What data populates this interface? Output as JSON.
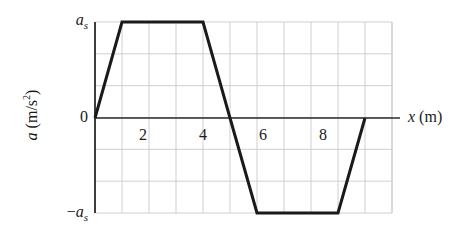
{
  "chart_data": {
    "type": "line",
    "title": "",
    "xlabel": "x (m)",
    "ylabel": "a (m/s2)",
    "ylabel_var": "a",
    "ylabel_unit_open": " (m/s",
    "ylabel_unit_exp": "2",
    "ylabel_unit_close": ")",
    "xlabel_var": "x",
    "xlabel_unit": " (m)",
    "x": [
      0,
      1,
      4,
      5,
      6,
      9,
      10
    ],
    "values": [
      0,
      1,
      1,
      0,
      -1,
      -1,
      0
    ],
    "value_units": "a_s",
    "xlim": [
      0,
      11
    ],
    "ylim": [
      -1.5,
      1.5
    ],
    "grid": true,
    "legend": "none",
    "xticks": [
      2,
      4,
      6,
      8
    ],
    "xtick_labels": [
      "2",
      "4",
      "6",
      "8"
    ],
    "yticks": [
      1,
      0,
      -1
    ],
    "ytick_labels": [
      "as",
      "0",
      "-as"
    ],
    "ytick_label_top_var": "a",
    "ytick_label_top_sub": "s",
    "ytick_label_zero": "0",
    "ytick_label_bottom_prefix": "−",
    "ytick_label_bottom_var": "a",
    "ytick_label_bottom_sub": "s",
    "series_name": "acceleration",
    "annotations": []
  },
  "style": {
    "line_color": "#1a1a1a",
    "axis_color": "#2b2b2b",
    "grid_color": "#c9c9cf",
    "background": "#ffffff"
  }
}
